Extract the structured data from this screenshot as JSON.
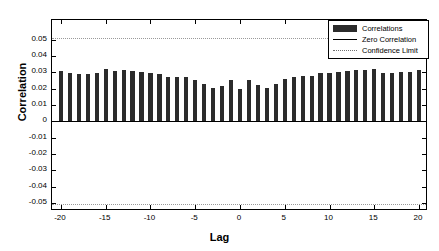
{
  "chart_data": {
    "type": "bar",
    "title": "",
    "xlabel": "Lag",
    "ylabel": "Correlation",
    "xlim": [
      -21,
      21
    ],
    "ylim": [
      -0.055,
      0.062
    ],
    "xticks": [
      -20,
      -15,
      -10,
      -5,
      0,
      5,
      10,
      15,
      20
    ],
    "xticklabels": [
      "-20",
      "-15",
      "-10",
      "-5",
      "0",
      "5",
      "10",
      "15",
      "20"
    ],
    "yticks": [
      0.05,
      0.04,
      0.03,
      0.02,
      0.01,
      0,
      -0.01,
      -0.02,
      -0.03,
      -0.04,
      -0.05
    ],
    "yticklabels": [
      "0.05",
      "0.04",
      "0.03",
      "0.02",
      "0.01",
      "0",
      "-0.01",
      "-0.02",
      "-0.03",
      "-0.04",
      "-0.05"
    ],
    "grid": false,
    "legend_position": "upper right",
    "zero_correlation": 0,
    "confidence_limit_upper": 0.0508,
    "confidence_limit_lower": -0.0508,
    "series_name": "Correlations",
    "bar_color": "#2b2b2b",
    "categories": [
      -20,
      -19,
      -18,
      -17,
      -16,
      -15,
      -14,
      -13,
      -12,
      -11,
      -10,
      -9,
      -8,
      -7,
      -6,
      -5,
      -4,
      -3,
      -2,
      -1,
      0,
      1,
      2,
      3,
      4,
      5,
      6,
      7,
      8,
      9,
      10,
      11,
      12,
      13,
      14,
      15,
      16,
      17,
      18,
      19,
      20
    ],
    "values": [
      0.0308,
      0.0294,
      0.0287,
      0.029,
      0.0294,
      0.0318,
      0.0308,
      0.0312,
      0.0305,
      0.0301,
      0.0295,
      0.0292,
      0.0272,
      0.0273,
      0.027,
      0.0255,
      0.0225,
      0.0203,
      0.0218,
      0.0251,
      0.0196,
      0.0253,
      0.0219,
      0.0206,
      0.0228,
      0.0257,
      0.0273,
      0.0276,
      0.0274,
      0.0296,
      0.0297,
      0.0302,
      0.0305,
      0.0313,
      0.0311,
      0.0319,
      0.0298,
      0.0298,
      0.0299,
      0.0301,
      0.0311
    ]
  },
  "legend": {
    "items": [
      {
        "label": "Correlations",
        "key": "patch"
      },
      {
        "label": "Zero Correlation",
        "key": "solid-line"
      },
      {
        "label": "Confidence Limit",
        "key": "dotted-line"
      }
    ]
  }
}
